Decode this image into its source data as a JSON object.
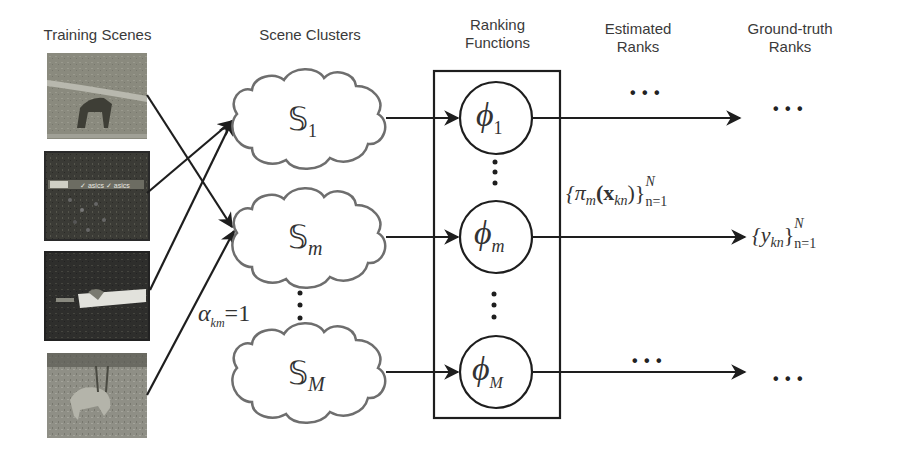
{
  "columns": {
    "training_scenes": "Training Scenes",
    "scene_clusters": "Scene Clusters",
    "ranking_functions_line1": "Ranking",
    "ranking_functions_line2": "Functions",
    "estimated_ranks_line1": "Estimated",
    "estimated_ranks_line2": "Ranks",
    "ground_truth_ranks_line1": "Ground-truth",
    "ground_truth_ranks_line2": "Ranks"
  },
  "training_images": [
    {
      "description": "horse on grass field",
      "tone": "#8a8a7e"
    },
    {
      "description": "soccer players with advertisement board",
      "tone": "#3b3b36"
    },
    {
      "description": "person diving on track with white board",
      "tone": "#2e2e2c"
    },
    {
      "description": "animal running on grass",
      "tone": "#8f8f86"
    }
  ],
  "clusters": [
    {
      "symbol": "𝕊",
      "subscript": "1"
    },
    {
      "symbol": "𝕊",
      "subscript": "m"
    },
    {
      "symbol": "𝕊",
      "subscript": "M"
    }
  ],
  "ranking_functions": [
    {
      "symbol": "ϕ",
      "subscript": "1"
    },
    {
      "symbol": "ϕ",
      "subscript": "m"
    },
    {
      "symbol": "ϕ",
      "subscript": "M"
    }
  ],
  "annotations": {
    "assignment_label": "α",
    "assignment_subscript": "km",
    "assignment_value": "=1",
    "estimated_rank_expr": "{π",
    "estimated_rank_sub_m": "m",
    "estimated_rank_arg": "(x",
    "estimated_rank_arg_sub": "kn",
    "estimated_rank_close": ")}",
    "estimated_rank_sup": "N",
    "estimated_rank_range": "n=1",
    "ground_truth_expr": "{y",
    "ground_truth_sub": "kn",
    "ground_truth_close": "}",
    "ground_truth_sup": "N",
    "ground_truth_range": "n=1",
    "ellipsis": "• • •",
    "vertical_ellipsis": "⋮"
  },
  "colors": {
    "line": "#1e1e1e",
    "cloud_stroke": "#6e6e6e",
    "text": "#3a3a3a"
  }
}
